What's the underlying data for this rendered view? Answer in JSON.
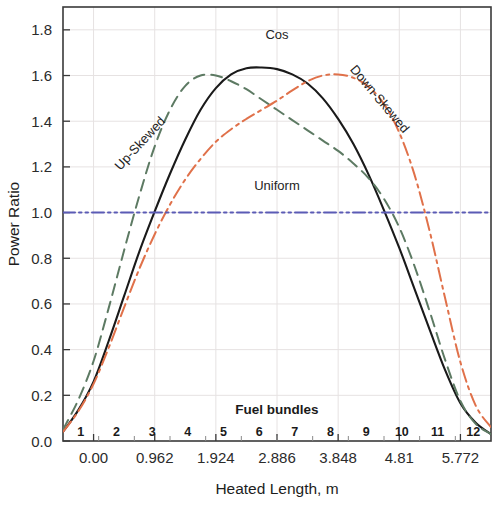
{
  "chart_data": {
    "type": "line",
    "title": "",
    "xlabel": "Heated Length, m",
    "ylabel": "Power Ratio",
    "xlim": [
      -0.4811,
      6.2531
    ],
    "ylim": [
      0.0,
      1.9
    ],
    "grid": true,
    "legend_position": "inline-labels",
    "x_tick_labels": [
      "0.00",
      "0.962",
      "1.924",
      "2.886",
      "3.848",
      "4.81",
      "5.772"
    ],
    "x_tick_values": [
      0.0,
      0.962,
      1.924,
      2.886,
      3.848,
      4.81,
      5.772
    ],
    "y_tick_labels": [
      "0.0",
      "0.2",
      "0.4",
      "0.6",
      "0.8",
      "1.0",
      "1.2",
      "1.4",
      "1.6",
      "1.8"
    ],
    "y_tick_values": [
      0.0,
      0.2,
      0.4,
      0.6,
      0.8,
      1.0,
      1.2,
      1.4,
      1.6,
      1.8
    ],
    "secondary_axis_title": "Fuel bundles",
    "bundle_labels": [
      "1",
      "2",
      "3",
      "4",
      "5",
      "6",
      "7",
      "8",
      "9",
      "10",
      "11",
      "12"
    ],
    "series": [
      {
        "name": "Cos",
        "color": "#1a1a1a",
        "dash": "solid",
        "label_x": 2.886,
        "label_y": 1.76,
        "label_rotation": 0,
        "x": [
          -0.4811,
          -0.2405,
          0.0,
          0.2405,
          0.481,
          0.7215,
          0.962,
          1.2025,
          1.443,
          1.6835,
          1.924,
          2.1645,
          2.405,
          2.6455,
          2.886,
          3.1265,
          3.367,
          3.6075,
          3.848,
          4.0885,
          4.329,
          4.5695,
          4.81,
          5.0505,
          5.291,
          5.5315,
          5.772,
          6.0125,
          6.2531
        ],
        "y": [
          0.04,
          0.135,
          0.26,
          0.44,
          0.635,
          0.83,
          1.005,
          1.17,
          1.32,
          1.45,
          1.545,
          1.605,
          1.632,
          1.635,
          1.628,
          1.605,
          1.565,
          1.5,
          1.41,
          1.3,
          1.165,
          1.01,
          0.845,
          0.665,
          0.485,
          0.31,
          0.165,
          0.08,
          0.03
        ]
      },
      {
        "name": "Up-Skewed",
        "color": "#5d7a63",
        "dash": "dashed",
        "label_x": 0.78,
        "label_y": 1.29,
        "label_rotation": -47,
        "x": [
          -0.4811,
          -0.2405,
          0.0,
          0.2405,
          0.481,
          0.7215,
          0.962,
          1.2025,
          1.443,
          1.6835,
          1.924,
          2.1645,
          2.405,
          2.6455,
          2.886,
          3.1265,
          3.367,
          3.6075,
          3.848,
          4.0885,
          4.329,
          4.5695,
          4.81,
          5.0505,
          5.291,
          5.5315,
          5.772,
          6.0125,
          6.2531
        ],
        "y": [
          0.05,
          0.18,
          0.35,
          0.585,
          0.835,
          1.075,
          1.29,
          1.45,
          1.555,
          1.6,
          1.6,
          1.575,
          1.54,
          1.495,
          1.45,
          1.405,
          1.36,
          1.315,
          1.27,
          1.215,
          1.15,
          1.06,
          0.935,
          0.765,
          0.565,
          0.355,
          0.175,
          0.075,
          0.03
        ]
      },
      {
        "name": "Down-Skewed",
        "color": "#e0714a",
        "dash": "dashdot",
        "label_x": 4.45,
        "label_y": 1.485,
        "label_rotation": 50,
        "x": [
          -0.4811,
          -0.2405,
          0.0,
          0.2405,
          0.481,
          0.7215,
          0.962,
          1.2025,
          1.443,
          1.6835,
          1.924,
          2.1645,
          2.405,
          2.6455,
          2.886,
          3.1265,
          3.367,
          3.6075,
          3.848,
          4.0885,
          4.329,
          4.5695,
          4.81,
          5.0505,
          5.291,
          5.5315,
          5.772,
          6.0125,
          6.2531
        ],
        "y": [
          0.04,
          0.13,
          0.25,
          0.41,
          0.585,
          0.755,
          0.905,
          1.035,
          1.145,
          1.235,
          1.31,
          1.365,
          1.41,
          1.45,
          1.49,
          1.535,
          1.575,
          1.6,
          1.605,
          1.59,
          1.55,
          1.475,
          1.35,
          1.165,
          0.915,
          0.625,
          0.345,
          0.155,
          0.06
        ]
      },
      {
        "name": "Uniform",
        "color": "#5b5bb5",
        "dash": "dashdotdot",
        "label_x": 2.886,
        "label_y": 1.1,
        "label_rotation": 0,
        "x": [
          -0.4811,
          6.2531
        ],
        "y": [
          1.0,
          1.0
        ]
      }
    ]
  }
}
